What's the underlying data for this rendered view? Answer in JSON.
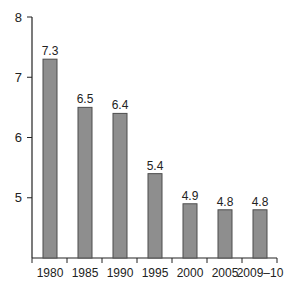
{
  "chart_data": {
    "type": "bar",
    "title": "",
    "xlabel": "",
    "ylabel": "",
    "categories": [
      "1980",
      "1985",
      "1990",
      "1995",
      "2000",
      "2005",
      "2009–10"
    ],
    "values": [
      7.3,
      6.5,
      6.4,
      5.4,
      4.9,
      4.8,
      4.8
    ],
    "value_labels": [
      "7.3",
      "6.5",
      "6.4",
      "5.4",
      "4.9",
      "4.8",
      "4.8"
    ],
    "ylim": [
      4,
      8
    ],
    "yticks": [
      5,
      6,
      7,
      8
    ],
    "ytick_labels": [
      "5",
      "6",
      "7",
      "8"
    ],
    "grid": false,
    "legend": null,
    "colors": {
      "bar_fill": "#8e8e8e",
      "bar_stroke": "#4d4d4d",
      "axis": "#222222"
    }
  }
}
